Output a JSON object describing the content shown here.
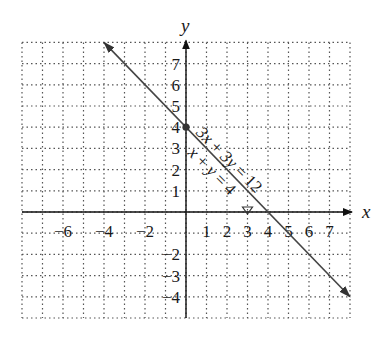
{
  "chart_data": {
    "type": "line",
    "title": "",
    "xlabel": "x",
    "ylabel": "y",
    "xlim": [
      -8,
      8
    ],
    "ylim": [
      -5,
      8
    ],
    "grid": "dotted",
    "x_ticks": [
      -6,
      -4,
      -2,
      1,
      2,
      3,
      4,
      5,
      6,
      7
    ],
    "x_tick_labels": [
      "−6",
      "−4",
      "−2",
      "1",
      "2",
      "3",
      "4",
      "5",
      "6",
      "7"
    ],
    "y_ticks": [
      7,
      6,
      5,
      4,
      3,
      2,
      1,
      -2,
      -3,
      -4
    ],
    "y_tick_labels": [
      "7",
      "6",
      "5",
      "4",
      "3",
      "2",
      "1",
      "−2",
      "−3",
      "−4"
    ],
    "series": [
      {
        "name": "3x + 3y = 12",
        "equation_label": "3x + 3y = 12",
        "slope": -1,
        "intercept": 4,
        "x": [
          -4,
          8
        ],
        "y": [
          8,
          -4
        ]
      },
      {
        "name": "x + y = 4",
        "equation_label": "x + y = 4",
        "slope": -1,
        "intercept": 4,
        "x": [
          -4,
          8
        ],
        "y": [
          8,
          -4
        ]
      }
    ],
    "points": [
      {
        "label": "y-intercept",
        "x": 0,
        "y": 4
      },
      {
        "label": "x-intercept",
        "x": 4,
        "y": 0
      }
    ],
    "annotations": [
      "3x + 3y = 12",
      "x + y = 4"
    ]
  }
}
